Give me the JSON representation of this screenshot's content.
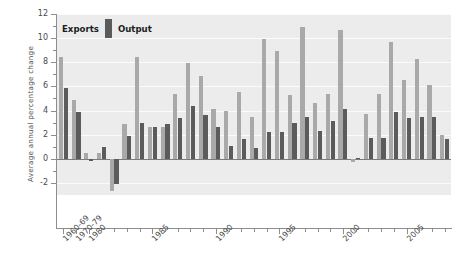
{
  "chart_data": {
    "type": "bar",
    "title": "",
    "xlabel": "",
    "ylabel": "Average annual percentage change",
    "ylim": [
      -3,
      12
    ],
    "yticks": [
      -2,
      0,
      2,
      4,
      6,
      8,
      10,
      12
    ],
    "ytick_labels": [
      "-2",
      "0",
      "2",
      "4",
      "6",
      "8",
      "10",
      "12"
    ],
    "grid": true,
    "grid_color": "#fbfbfb",
    "background": "#ececec",
    "legend_position": "upper left",
    "orientation": "vertical",
    "categories": [
      "1960-69",
      "1970-79",
      "1980",
      "1981",
      "1982",
      "1983",
      "1984",
      "1985",
      "1986",
      "1987",
      "1988",
      "1989",
      "1990",
      "1991",
      "1992",
      "1993",
      "1994",
      "1995",
      "1996",
      "1997",
      "1998",
      "1999",
      "2000",
      "2001",
      "2002",
      "2003",
      "2004",
      "2005",
      "2006",
      "2007",
      "2008"
    ],
    "xtick_labels": [
      "1960-69",
      "1970-79",
      "1980",
      "1985",
      "1990",
      "1995",
      "2000",
      "2005"
    ],
    "xtick_categories": [
      "1960-69",
      "1970-79",
      "1980",
      "1985",
      "1990",
      "1995",
      "2000",
      "2005"
    ],
    "series": [
      {
        "name": "Exports",
        "color": "#a9a9a9",
        "values": [
          8.4,
          4.9,
          0.5,
          0.5,
          -2.7,
          2.9,
          8.4,
          2.6,
          2.6,
          5.4,
          7.9,
          6.9,
          4.1,
          4.0,
          5.5,
          3.5,
          9.9,
          8.9,
          5.3,
          10.9,
          4.6,
          5.4,
          10.7,
          -0.3,
          3.7,
          5.4,
          9.7,
          6.5,
          8.3,
          6.1,
          2.0
        ]
      },
      {
        "name": "Output",
        "color": "#5b5b5b",
        "values": [
          5.9,
          3.9,
          -0.2,
          1.0,
          -2.1,
          1.9,
          3.0,
          2.6,
          2.9,
          3.4,
          4.4,
          3.6,
          2.6,
          1.1,
          1.6,
          0.9,
          2.2,
          2.2,
          3.0,
          3.5,
          2.3,
          3.1,
          4.1,
          0.1,
          1.7,
          1.7,
          3.9,
          3.4,
          3.5,
          3.5,
          1.6
        ]
      }
    ]
  },
  "legend": {
    "items": [
      {
        "label": "Exports",
        "color": "#a9a9a9"
      },
      {
        "label": "Output",
        "color": "#5b5b5b"
      }
    ]
  },
  "axes": {
    "y_title": "Average annual percentage change"
  }
}
